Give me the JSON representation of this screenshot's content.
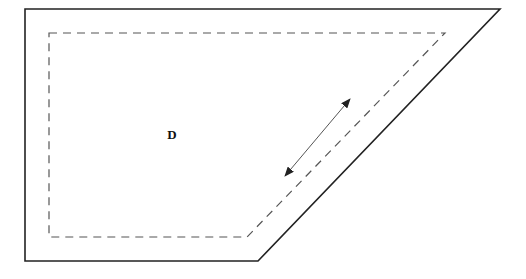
{
  "diagram": {
    "label": "D",
    "label_position": [
      172,
      139
    ],
    "outer_boundary": {
      "points": [
        [
          25,
          9
        ],
        [
          500,
          9
        ],
        [
          258,
          261
        ],
        [
          25,
          261
        ]
      ],
      "stroke": "#222222",
      "stroke_width": 1.6
    },
    "inner_boundary": {
      "style": "dashed",
      "points": [
        [
          49,
          33
        ],
        [
          445,
          33
        ],
        [
          247,
          237
        ],
        [
          49,
          237
        ]
      ],
      "stroke": "#555555",
      "stroke_width": 1.2,
      "dash": "8,6"
    },
    "arrow": {
      "type": "double-headed",
      "from": [
        285,
        176
      ],
      "to": [
        350,
        99
      ],
      "stroke": "#555555"
    }
  }
}
